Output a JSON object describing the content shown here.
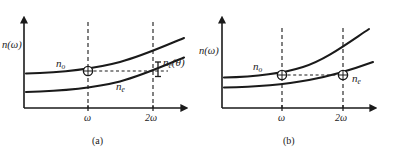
{
  "figure": {
    "type": "physics-diagram",
    "background_color": "#ffffff",
    "line_color": "#1a1a1a",
    "panels": [
      {
        "id": "a",
        "caption": "(a)",
        "axes": {
          "y_label": "n(ω)",
          "x_ticks": [
            "ω",
            "2ω"
          ],
          "x_arrow": true,
          "y_arrow": true
        },
        "curves": [
          {
            "name": "n_o",
            "label": "n",
            "sub": "o",
            "role": "ordinary-index"
          },
          {
            "name": "n_e",
            "label": "n",
            "sub": "e",
            "role": "extraordinary-index"
          }
        ],
        "annotations": [
          {
            "name": "gap-bracket",
            "label": "n",
            "sub": "e",
            "suffix": "(θ)",
            "role": "index-mismatch-at-2omega"
          }
        ],
        "markers": [
          {
            "name": "marker-omega-ordinary",
            "x_tick": "ω",
            "curve": "n_o"
          }
        ],
        "guides": {
          "vertical_dashed": [
            "ω",
            "2ω"
          ],
          "horizontal_dashed": true
        },
        "phase_matched": false
      },
      {
        "id": "b",
        "caption": "(b)",
        "axes": {
          "y_label": "n(ω)",
          "x_ticks": [
            "ω",
            "2ω"
          ],
          "x_arrow": true,
          "y_arrow": true
        },
        "curves": [
          {
            "name": "n_o",
            "label": "n",
            "sub": "o",
            "role": "ordinary-index"
          },
          {
            "name": "n_e",
            "label": "n",
            "sub": "e",
            "role": "extraordinary-index"
          }
        ],
        "annotations": [],
        "markers": [
          {
            "name": "marker-omega-ordinary",
            "x_tick": "ω",
            "curve": "n_o"
          },
          {
            "name": "marker-2omega-extraordinary",
            "x_tick": "2ω",
            "curve": "n_e"
          }
        ],
        "guides": {
          "vertical_dashed": [
            "ω",
            "2ω"
          ],
          "horizontal_dashed": true
        },
        "phase_matched": true
      }
    ]
  }
}
